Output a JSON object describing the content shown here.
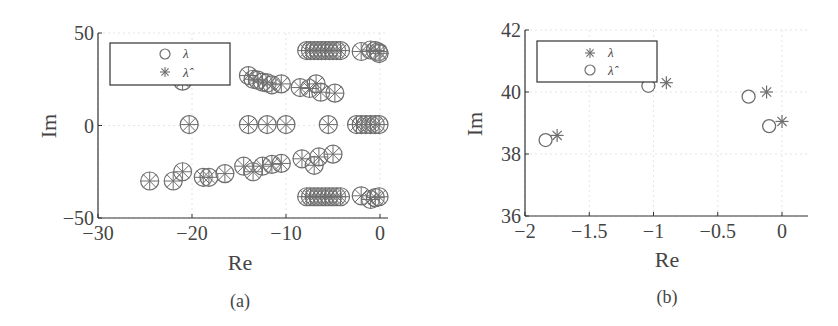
{
  "chart_data": [
    {
      "panel": "(a)",
      "type": "scatter",
      "title": "",
      "xlabel": "Re",
      "ylabel": "Im",
      "xlim": [
        -30,
        0.5
      ],
      "ylim": [
        -50,
        50
      ],
      "xticks": [
        "-30",
        "-20",
        "-10",
        "0"
      ],
      "yticks": [
        "50",
        "0",
        "-50"
      ],
      "grid": true,
      "legend_position": "upper left",
      "legend": [
        {
          "marker": "circle",
          "label": "λ"
        },
        {
          "marker": "asterisk",
          "label": "λ̂"
        }
      ],
      "series": [
        {
          "name": "λ",
          "marker": "circle",
          "points": [
            [
              -7.8,
              40.5
            ],
            [
              -7.4,
              40.5
            ],
            [
              -7.0,
              40.5
            ],
            [
              -6.6,
              40.5
            ],
            [
              -6.2,
              40.5
            ],
            [
              -5.8,
              40.5
            ],
            [
              -5.4,
              40.5
            ],
            [
              -5.0,
              40.5
            ],
            [
              -4.6,
              40.5
            ],
            [
              -4.2,
              40.5
            ],
            [
              -2.0,
              40.0
            ],
            [
              -1.0,
              40.8
            ],
            [
              -0.5,
              40.5
            ],
            [
              -0.2,
              39.8
            ],
            [
              -0.1,
              38.9
            ],
            [
              -14.0,
              27.0
            ],
            [
              -13.5,
              25.0
            ],
            [
              -13.0,
              24.5
            ],
            [
              -12.5,
              23.5
            ],
            [
              -12.0,
              23.0
            ],
            [
              -11.5,
              22.0
            ],
            [
              -10.5,
              22.5
            ],
            [
              -21.0,
              24.0
            ],
            [
              -8.5,
              20.5
            ],
            [
              -7.5,
              20.0
            ],
            [
              -6.8,
              22.5
            ],
            [
              -6.3,
              18.0
            ],
            [
              -4.8,
              17.5
            ],
            [
              -20.3,
              0.5
            ],
            [
              -14.0,
              0.5
            ],
            [
              -12.0,
              0.5
            ],
            [
              -10.0,
              0.5
            ],
            [
              -5.5,
              0.5
            ],
            [
              -2.5,
              0.5
            ],
            [
              -2.0,
              0.5
            ],
            [
              -1.5,
              0.5
            ],
            [
              -1.0,
              0.5
            ],
            [
              -0.5,
              0.5
            ],
            [
              -0.1,
              0.5
            ],
            [
              -8.3,
              -18.0
            ],
            [
              -7.0,
              -21.5
            ],
            [
              -6.5,
              -17.0
            ],
            [
              -5.0,
              -15.5
            ],
            [
              -14.5,
              -22.0
            ],
            [
              -13.5,
              -25.0
            ],
            [
              -12.5,
              -22.0
            ],
            [
              -11.5,
              -21.0
            ],
            [
              -10.5,
              -20.5
            ],
            [
              -24.5,
              -30.0
            ],
            [
              -22.0,
              -30.0
            ],
            [
              -21.0,
              -25.0
            ],
            [
              -18.8,
              -28.0
            ],
            [
              -18.2,
              -28.0
            ],
            [
              -16.5,
              -26.0
            ],
            [
              -7.8,
              -38.5
            ],
            [
              -7.4,
              -38.5
            ],
            [
              -7.0,
              -38.5
            ],
            [
              -6.6,
              -38.5
            ],
            [
              -6.2,
              -38.5
            ],
            [
              -5.8,
              -38.5
            ],
            [
              -5.4,
              -38.5
            ],
            [
              -5.0,
              -38.5
            ],
            [
              -4.6,
              -38.5
            ],
            [
              -4.2,
              -38.5
            ],
            [
              -2.0,
              -38.0
            ],
            [
              -1.0,
              -40.0
            ],
            [
              -0.5,
              -39.0
            ],
            [
              -0.1,
              -38.5
            ]
          ]
        },
        {
          "name": "λ̂",
          "marker": "asterisk",
          "points": [
            [
              -7.8,
              40.5
            ],
            [
              -7.4,
              40.5
            ],
            [
              -7.0,
              40.5
            ],
            [
              -6.6,
              40.5
            ],
            [
              -6.2,
              40.5
            ],
            [
              -5.8,
              40.5
            ],
            [
              -5.4,
              40.5
            ],
            [
              -5.0,
              40.5
            ],
            [
              -4.6,
              40.5
            ],
            [
              -4.2,
              40.5
            ],
            [
              -2.0,
              40.0
            ],
            [
              -1.0,
              40.8
            ],
            [
              -0.5,
              40.5
            ],
            [
              -0.1,
              40.0
            ],
            [
              0.0,
              39.0
            ],
            [
              -14.0,
              27.0
            ],
            [
              -13.5,
              25.0
            ],
            [
              -13.0,
              24.5
            ],
            [
              -12.5,
              23.5
            ],
            [
              -12.0,
              23.0
            ],
            [
              -11.5,
              22.0
            ],
            [
              -10.5,
              22.5
            ],
            [
              -21.0,
              24.0
            ],
            [
              -8.5,
              20.5
            ],
            [
              -7.5,
              20.0
            ],
            [
              -6.8,
              22.5
            ],
            [
              -6.3,
              18.0
            ],
            [
              -4.8,
              17.5
            ],
            [
              -20.3,
              0.5
            ],
            [
              -14.0,
              0.5
            ],
            [
              -12.0,
              0.5
            ],
            [
              -10.0,
              0.5
            ],
            [
              -5.5,
              0.5
            ],
            [
              -2.5,
              0.5
            ],
            [
              -2.0,
              0.5
            ],
            [
              -1.5,
              0.5
            ],
            [
              -1.0,
              0.5
            ],
            [
              -0.5,
              0.5
            ],
            [
              -0.1,
              0.5
            ],
            [
              -8.3,
              -18.0
            ],
            [
              -7.0,
              -21.5
            ],
            [
              -6.5,
              -17.0
            ],
            [
              -5.0,
              -15.5
            ],
            [
              -14.5,
              -22.0
            ],
            [
              -13.5,
              -25.0
            ],
            [
              -12.5,
              -22.0
            ],
            [
              -11.5,
              -21.0
            ],
            [
              -10.5,
              -20.5
            ],
            [
              -24.5,
              -30.0
            ],
            [
              -22.0,
              -30.0
            ],
            [
              -21.0,
              -25.0
            ],
            [
              -18.8,
              -28.0
            ],
            [
              -18.2,
              -28.0
            ],
            [
              -16.5,
              -26.0
            ],
            [
              -7.8,
              -38.5
            ],
            [
              -7.4,
              -38.5
            ],
            [
              -7.0,
              -38.5
            ],
            [
              -6.6,
              -38.5
            ],
            [
              -6.2,
              -38.5
            ],
            [
              -5.8,
              -38.5
            ],
            [
              -5.4,
              -38.5
            ],
            [
              -5.0,
              -38.5
            ],
            [
              -4.6,
              -38.5
            ],
            [
              -4.2,
              -38.5
            ],
            [
              -2.0,
              -38.0
            ],
            [
              -1.0,
              -40.0
            ],
            [
              -0.5,
              -39.0
            ],
            [
              -0.1,
              -38.5
            ]
          ]
        }
      ]
    },
    {
      "panel": "(b)",
      "type": "scatter",
      "title": "",
      "xlabel": "Re",
      "ylabel": "Im",
      "xlim": [
        -2,
        0.2
      ],
      "ylim": [
        36,
        42
      ],
      "xticks": [
        "-2",
        "-1.5",
        "-1",
        "-0.5",
        "0"
      ],
      "yticks": [
        "42",
        "40",
        "38",
        "36"
      ],
      "grid": true,
      "legend_position": "upper left",
      "legend": [
        {
          "marker": "asterisk",
          "label": "λ"
        },
        {
          "marker": "circle",
          "label": "λ̂"
        }
      ],
      "series": [
        {
          "name": "λ",
          "marker": "asterisk",
          "points": [
            [
              -1.75,
              38.6
            ],
            [
              -0.9,
              40.3
            ],
            [
              -0.12,
              40.0
            ],
            [
              0.0,
              39.05
            ]
          ]
        },
        {
          "name": "λ̂",
          "marker": "circle",
          "points": [
            [
              -1.84,
              38.45
            ],
            [
              -1.04,
              40.2
            ],
            [
              -0.26,
              39.85
            ],
            [
              -0.1,
              38.9
            ]
          ]
        }
      ]
    }
  ],
  "panels": {
    "a": {
      "caption": "(a)",
      "xlabel": "Re",
      "ylabel": "Im",
      "xticks": [
        {
          "v": -30,
          "label": "−30"
        },
        {
          "v": -20,
          "label": "−20"
        },
        {
          "v": -10,
          "label": "−10"
        },
        {
          "v": 0,
          "label": "0"
        }
      ],
      "yticks": [
        {
          "v": 50,
          "label": "50"
        },
        {
          "v": 0,
          "label": "0"
        },
        {
          "v": -50,
          "label": "−50"
        }
      ],
      "legend": {
        "item1": "λ",
        "item2": "λ̂"
      }
    },
    "b": {
      "caption": "(b)",
      "xlabel": "Re",
      "ylabel": "Im",
      "xticks": [
        {
          "v": -2,
          "label": "−2"
        },
        {
          "v": -1.5,
          "label": "−1.5"
        },
        {
          "v": -1,
          "label": "−1"
        },
        {
          "v": -0.5,
          "label": "−0.5"
        },
        {
          "v": 0,
          "label": "0"
        }
      ],
      "yticks": [
        {
          "v": 42,
          "label": "42"
        },
        {
          "v": 40,
          "label": "40"
        },
        {
          "v": 38,
          "label": "38"
        },
        {
          "v": 36,
          "label": "36"
        }
      ],
      "legend": {
        "item1": "λ",
        "item2": "λ̂"
      }
    }
  },
  "colors": {
    "marker": "#6e6e6e",
    "axis": "#333333",
    "grid": "#e4e4e4",
    "fill_dense": "#7a7a7a"
  }
}
